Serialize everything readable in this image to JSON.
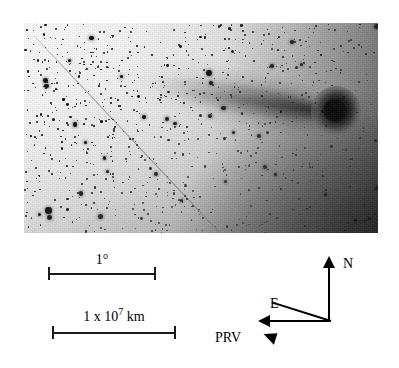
{
  "figure": {
    "type": "astronomical-plate-figure"
  },
  "plate": {
    "name": "comet-plate-image",
    "alt": "Comet with bright coma at upper right and a broad tail extending toward lower left across a dense star field",
    "subject": "comet",
    "rendering": "negative",
    "features": {
      "coma_label": "comet coma",
      "tail_label": "comet tail",
      "streak_label": "satellite trail",
      "field_label": "star field"
    }
  },
  "scales": [
    {
      "id": "angular-scale",
      "label": "1°",
      "value": "1",
      "unit": "degree",
      "bar_length_px": 108
    },
    {
      "id": "linear-scale",
      "label_prefix": "1 x 10",
      "label_exponent": "7",
      "label_suffix": "km",
      "value": "1 x 10^7",
      "unit": "km",
      "bar_length_px": 124
    }
  ],
  "compass": {
    "name": "orientation-compass",
    "north": {
      "label": "N",
      "direction": "up"
    },
    "east": {
      "label": "E",
      "direction": "left"
    },
    "prv": {
      "label": "PRV",
      "direction": "lower-left",
      "meaning": "projected radius vector"
    }
  },
  "colors": {
    "ink": "#000000",
    "plate_light": "#fbfbfb",
    "plate_dark": "#5a5a5a",
    "background": "#ffffff"
  }
}
